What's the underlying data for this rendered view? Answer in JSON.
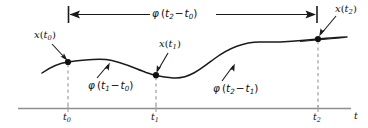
{
  "figure": {
    "kind": "signal-flow-diagram",
    "background_color": "#ffffff",
    "ink_color": "#1a1a1a",
    "axis_color": "#8a8a8a",
    "dash_color": "#9a9a9a",
    "axis": {
      "x_axis_label": "t",
      "tick_labels": [
        "t0",
        "t1",
        "t2"
      ],
      "tick_label_display": [
        "t₀",
        "t₁",
        "t₂"
      ]
    },
    "labels": {
      "x_t0": "x(t0)",
      "x_t1": "x(t1)",
      "x_t2": "x(t2)",
      "phi_t2_t0": "φ (t2 − t0)",
      "phi_t1_t0": "φ (t1 − t0)",
      "phi_t2_t1": "φ (t2 − t1)"
    },
    "label_parts": {
      "x": "x",
      "phi": "φ",
      "open_paren": "(",
      "close_paren": ")",
      "minus": "−",
      "sub_0": "0",
      "sub_1": "1",
      "sub_2": "2",
      "t": "t"
    },
    "markers": [
      {
        "name": "point-t0",
        "x": 68,
        "y": 62
      },
      {
        "name": "point-t1",
        "x": 156,
        "y": 75
      },
      {
        "name": "point-t2",
        "x": 318,
        "y": 39
      }
    ],
    "dimension_line": {
      "y": 14,
      "x_start": 68,
      "x_end": 317,
      "arrowheads": "both"
    }
  }
}
